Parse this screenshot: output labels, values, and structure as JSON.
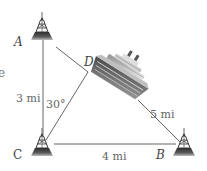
{
  "diagram": {
    "points": {
      "A": {
        "label": "A"
      },
      "B": {
        "label": "B"
      },
      "C": {
        "label": "C"
      },
      "D": {
        "label": "D"
      }
    },
    "distances": {
      "AC": "3 mi",
      "CB": "4 mi",
      "DB": "5 mi"
    },
    "angle": {
      "ACD": "30°"
    },
    "edge_fragment": "e",
    "icons": {
      "tower": "radio-tower-icon",
      "ship": "cruise-ship-icon"
    },
    "colors": {
      "line": "#555555",
      "tower_dark": "#3a3a3a",
      "tower_base": "#6e6e6e",
      "ship_hull": "#7a7a7a",
      "ship_light": "#d8d8d8",
      "text": "#555555"
    }
  }
}
